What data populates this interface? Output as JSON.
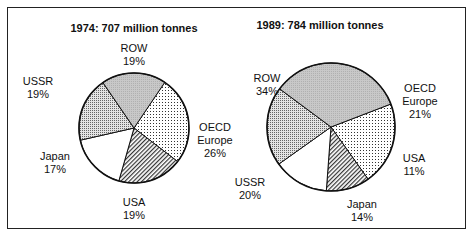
{
  "chart_data": [
    {
      "type": "pie",
      "title": "1974:  707 million tonnes",
      "slices": [
        {
          "label": [
            "OECD",
            "Europe",
            "26%"
          ],
          "name": "OECD Europe",
          "value": 26,
          "pattern": "grid-dots"
        },
        {
          "label": [
            "USA",
            "19%"
          ],
          "name": "USA",
          "value": 19,
          "pattern": "hatch"
        },
        {
          "label": [
            "Japan",
            "17%"
          ],
          "name": "Japan",
          "value": 17,
          "pattern": "white"
        },
        {
          "label": [
            "USSR",
            "19%"
          ],
          "name": "USSR",
          "value": 19,
          "pattern": "fine-dots"
        },
        {
          "label": [
            "ROW",
            "19%"
          ],
          "name": "ROW",
          "value": 19,
          "pattern": "grey"
        }
      ]
    },
    {
      "type": "pie",
      "title": "1989:  784 million tonnes",
      "slices": [
        {
          "label": [
            "OECD",
            "Europe",
            "21%"
          ],
          "name": "OECD Europe",
          "value": 21,
          "pattern": "grid-dots"
        },
        {
          "label": [
            "USA",
            "11%"
          ],
          "name": "USA",
          "value": 11,
          "pattern": "hatch"
        },
        {
          "label": [
            "Japan",
            "14%"
          ],
          "name": "Japan",
          "value": 14,
          "pattern": "white"
        },
        {
          "label": [
            "USSR",
            "20%"
          ],
          "name": "USSR",
          "value": 20,
          "pattern": "fine-dots"
        },
        {
          "label": [
            "ROW",
            "34%"
          ],
          "name": "ROW",
          "value": 34,
          "pattern": "grey"
        }
      ]
    }
  ]
}
